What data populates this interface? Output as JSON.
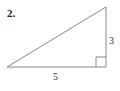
{
  "problem": {
    "number": "2.",
    "side_vertical_label": "3",
    "side_base_label": "5"
  },
  "diagram": {
    "type": "right-triangle",
    "vertices": {
      "left": [
        7,
        67
      ],
      "right_angle": [
        106,
        67
      ],
      "top": [
        106,
        7
      ]
    },
    "right_angle_marker": true,
    "stroke_color": "#888888"
  }
}
